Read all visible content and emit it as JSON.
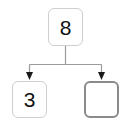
{
  "canvas": {
    "width": 131,
    "height": 126,
    "background_color": "#ffffff"
  },
  "diagram": {
    "type": "binary-tree",
    "node_border_color": "#cfcfcf",
    "highlight_border_color": "#8a8a8a",
    "connector_color": "#9a9a9a",
    "arrowhead_color": "#1a1a1a",
    "text_color": "#111111",
    "nodes": [
      {
        "id": "root",
        "label": "8",
        "state": "normal",
        "empty": false
      },
      {
        "id": "left-child",
        "label": "3",
        "state": "normal",
        "empty": false
      },
      {
        "id": "right-child",
        "label": "",
        "state": "highlighted",
        "empty": true
      }
    ],
    "edges": [
      {
        "from": "root",
        "to": "left-child",
        "arrow": true
      },
      {
        "from": "root",
        "to": "right-child",
        "arrow": true
      }
    ]
  }
}
